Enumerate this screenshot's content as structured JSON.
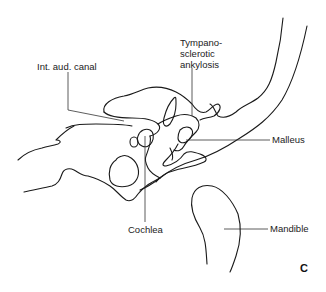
{
  "figure": {
    "panel_letter": "C",
    "labels": {
      "int_aud_canal": "Int. aud. canal",
      "tympanosclerotic_line1": "Tympano-",
      "tympanosclerotic_line2": "sclerotic",
      "tympanosclerotic_line3": "ankylosis",
      "malleus": "Malleus",
      "cochlea": "Cochlea",
      "mandible": "Mandible"
    },
    "colors": {
      "stroke": "#1a1a1a",
      "leader": "#333333",
      "background": "#ffffff"
    }
  }
}
